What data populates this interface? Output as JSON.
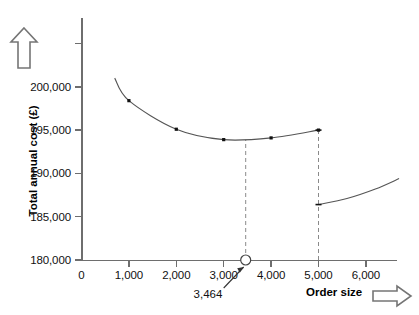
{
  "chart_data": {
    "type": "line",
    "title": "",
    "xlabel": "Order size",
    "ylabel": "Total annual cost (£)",
    "xlim": [
      0,
      6800
    ],
    "ylim": [
      180000,
      201800
    ],
    "grid": false,
    "legend": false,
    "y_ticks": [
      {
        "value": 180000,
        "label": "180,000"
      },
      {
        "value": 185000,
        "label": "185,000"
      },
      {
        "value": 190000,
        "label": "190,000"
      },
      {
        "value": 195000,
        "label": "195,000"
      },
      {
        "value": 200000,
        "label": "200,000"
      }
    ],
    "y_unlabelled_ticks": [
      205000
    ],
    "x_ticks": [
      {
        "value": 0,
        "label": "0"
      },
      {
        "value": 1000,
        "label": "1,000"
      },
      {
        "value": 2000,
        "label": "2,000"
      },
      {
        "value": 3000,
        "label": "3,000"
      },
      {
        "value": 4000,
        "label": "4,000"
      },
      {
        "value": 5000,
        "label": "5,000"
      },
      {
        "value": 6000,
        "label": "6,000"
      }
    ],
    "series": [
      {
        "name": "Total annual cost (no discount band)",
        "segment": "lower-order-band",
        "x": [
          700,
          1000,
          2000,
          3000,
          4000,
          5000,
          5000
        ],
        "values": [
          201000,
          198400,
          195100,
          193900,
          194100,
          195000,
          195000
        ],
        "markers_x": [
          1000,
          2000,
          3000,
          4000,
          5000
        ],
        "markers_y": [
          198400,
          195100,
          193900,
          194100,
          195000
        ]
      },
      {
        "name": "Total annual cost (discounted band)",
        "segment": "upper-order-band",
        "x": [
          5000,
          5600,
          6200,
          6700
        ],
        "values": [
          186400,
          187100,
          188200,
          189400
        ],
        "markers_x": [],
        "markers_y": []
      }
    ],
    "annotations": [
      {
        "name": "optimum-order-quantity",
        "label": "3,464",
        "x": 3464,
        "y": 180000,
        "marker": "open-circle",
        "leader": "arrow-up-right"
      },
      {
        "name": "eoq-dropline",
        "x": 3464,
        "style": "dashed-vertical",
        "from_y": 180000,
        "to_y": 193900
      },
      {
        "name": "discount-break-dropline",
        "x": 5000,
        "style": "dashed-vertical",
        "from_y": 180000,
        "to_y": 195000
      }
    ],
    "icons": {
      "y_axis_direction": "arrow-up-outline",
      "x_axis_direction": "arrow-right-outline"
    },
    "colors": {
      "axis": "#6e6e6e",
      "curve": "#555555",
      "marker": "#111111",
      "dashed": "#8a8a8a",
      "text": "#000000",
      "background": "#ffffff"
    }
  }
}
